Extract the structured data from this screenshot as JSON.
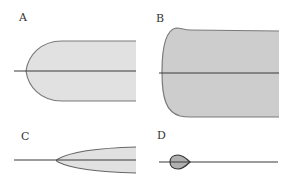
{
  "panels": [
    {
      "id": "A",
      "label": "A"
    },
    {
      "id": "B",
      "label": "B"
    },
    {
      "id": "C",
      "label": "C"
    },
    {
      "id": "D",
      "label": "D"
    }
  ],
  "colors": {
    "fill_light": "#e1e1e1",
    "fill_dark": "#cdcdcd",
    "outline": "#7a7a7a",
    "axis_line": "#3a3a3a"
  }
}
